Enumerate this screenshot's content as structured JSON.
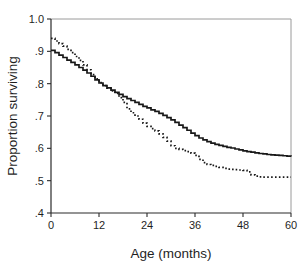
{
  "chart_data": {
    "type": "line",
    "title": "",
    "subtitle": "",
    "xlabel": "Age (months)",
    "ylabel": "Proportion surviving",
    "xlim": [
      0,
      60
    ],
    "ylim": [
      0.4,
      1.0
    ],
    "xticks": [
      0,
      12,
      24,
      36,
      48,
      60
    ],
    "xticklabels": [
      "0",
      "12",
      "24",
      "36",
      "48",
      "60"
    ],
    "yticks": [
      0.4,
      0.5,
      0.6,
      0.7,
      0.8,
      0.9,
      1.0
    ],
    "yticklabels": [
      ".4",
      ".5",
      ".6",
      ".7",
      ".8",
      ".9",
      "1.0"
    ],
    "grid": false,
    "legend": "none",
    "interpolation": "step-post",
    "series": [
      {
        "name": "solid-curve",
        "style": "solid",
        "color": "#181818",
        "x": [
          0,
          1,
          2,
          3,
          4,
          5,
          6,
          7,
          8,
          9,
          10,
          11,
          12,
          13,
          14,
          15,
          16,
          17,
          18,
          19,
          20,
          21,
          22,
          23,
          24,
          25,
          26,
          27,
          28,
          29,
          30,
          31,
          32,
          33,
          34,
          35,
          36,
          37,
          38,
          39,
          40,
          41,
          42,
          43,
          44,
          45,
          46,
          47,
          48,
          49,
          50,
          51,
          52,
          53,
          54,
          55,
          56,
          57,
          58,
          59,
          60
        ],
        "values": [
          0.903,
          0.896,
          0.888,
          0.881,
          0.873,
          0.866,
          0.858,
          0.85,
          0.842,
          0.833,
          0.823,
          0.812,
          0.802,
          0.794,
          0.787,
          0.78,
          0.773,
          0.767,
          0.76,
          0.754,
          0.748,
          0.742,
          0.736,
          0.73,
          0.725,
          0.719,
          0.714,
          0.708,
          0.702,
          0.695,
          0.688,
          0.68,
          0.672,
          0.664,
          0.656,
          0.647,
          0.639,
          0.632,
          0.626,
          0.621,
          0.616,
          0.612,
          0.609,
          0.606,
          0.603,
          0.601,
          0.598,
          0.595,
          0.592,
          0.59,
          0.588,
          0.586,
          0.584,
          0.583,
          0.581,
          0.58,
          0.579,
          0.578,
          0.577,
          0.576,
          0.575
        ]
      },
      {
        "name": "dotted-curve",
        "style": "dotted",
        "color": "#181818",
        "x": [
          0,
          1,
          2,
          3,
          4,
          5,
          6,
          7,
          8,
          9,
          10,
          11,
          12,
          13,
          14,
          15,
          16,
          17,
          18,
          19,
          20,
          21,
          22,
          23,
          24,
          25,
          26,
          27,
          28,
          29,
          30,
          31,
          32,
          33,
          34,
          35,
          36,
          37,
          38,
          39,
          40,
          41,
          42,
          43,
          44,
          45,
          46,
          47,
          48,
          49,
          50,
          51,
          52,
          53,
          54,
          55,
          56,
          57,
          58,
          59,
          60
        ],
        "values": [
          0.94,
          0.932,
          0.924,
          0.916,
          0.906,
          0.896,
          0.884,
          0.872,
          0.858,
          0.843,
          0.828,
          0.815,
          0.803,
          0.794,
          0.786,
          0.778,
          0.77,
          0.757,
          0.742,
          0.722,
          0.71,
          0.7,
          0.69,
          0.678,
          0.668,
          0.661,
          0.654,
          0.645,
          0.634,
          0.622,
          0.608,
          0.6,
          0.597,
          0.593,
          0.59,
          0.585,
          0.578,
          0.566,
          0.556,
          0.55,
          0.547,
          0.544,
          0.541,
          0.538,
          0.536,
          0.535,
          0.534,
          0.533,
          0.532,
          0.527,
          0.518,
          0.514,
          0.512,
          0.511,
          0.511,
          0.511,
          0.511,
          0.511,
          0.511,
          0.511,
          0.511
        ]
      }
    ]
  }
}
